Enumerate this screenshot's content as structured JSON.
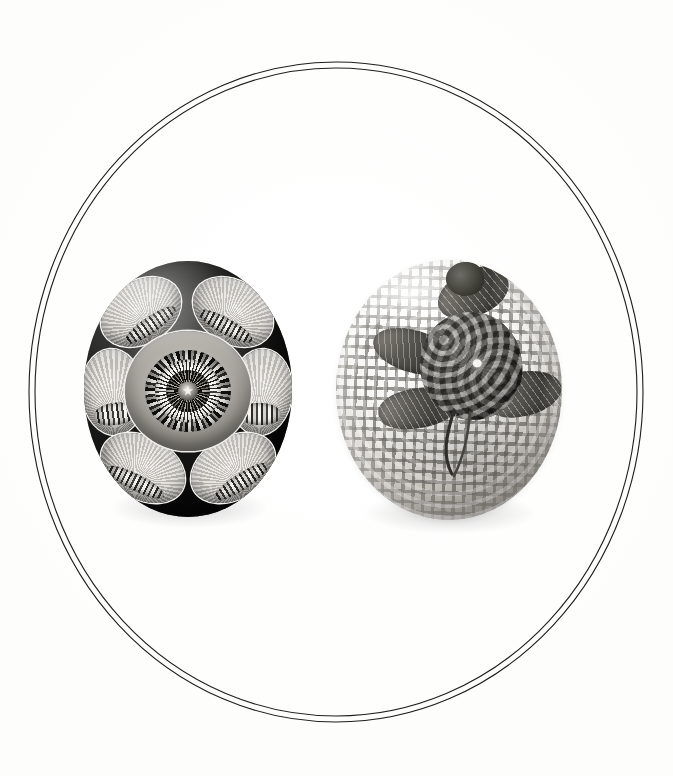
{
  "plate": {
    "title": "Two glass paperweights",
    "caption": "",
    "background_color": "#fdfdfd",
    "frame": {
      "type": "double-oval-rule",
      "line_color": "#1d1d1d",
      "line_count": 2,
      "outer": {
        "cx": 336,
        "cy": 392,
        "rx": 307,
        "ry": 330
      },
      "inner": {
        "cx": 336,
        "cy": 392,
        "rx": 301,
        "ry": 324
      }
    }
  },
  "objects": [
    {
      "id": "paperweight-left",
      "name": "faceted millefiori paperweight",
      "position": {
        "x": 84,
        "y": 261,
        "width": 208,
        "height": 256
      },
      "ground_tone": "dark",
      "ground_color": "#141413",
      "center_motif": "concentric millefiori cane rosette",
      "center_rings": 4,
      "facet_windows": 8,
      "facet_window_motif": "radiating fan with cane cluster",
      "highlight_color": "#eceae5"
    },
    {
      "id": "paperweight-right",
      "name": "strawberry on latticino ground paperweight",
      "position": {
        "x": 336,
        "y": 260,
        "width": 226,
        "height": 260
      },
      "ground_tone": "light",
      "ground_color": "#f6f5f2",
      "ground_motif": "white latticino muslin grid",
      "center_motif": "textured berry fruit",
      "leaf_count": 4,
      "stem_count": 2,
      "berry_color": "#4a4944"
    }
  ]
}
